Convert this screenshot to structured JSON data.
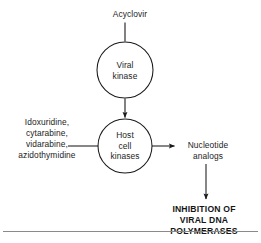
{
  "figure": {
    "background_color": "#ffffff",
    "stroke_color": "#1a1a1a",
    "rule_color": "#8a8a8a"
  },
  "nodes": {
    "viral_kinase": {
      "label": "Viral\nkinase",
      "shape": "circle",
      "cx": 125,
      "cy": 70,
      "r": 28
    },
    "host_cell_kinases": {
      "label": "Host\ncell\nkinases",
      "shape": "circle",
      "cx": 125,
      "cy": 146,
      "r": 27
    }
  },
  "labels": {
    "acyclovir": "Acyclovir",
    "substrates": "Idoxuridine,\ncytarabine,\nvidarabine,\nazidothymidine",
    "nucleotide_analogs": "Nucleotide\nanalogs",
    "inhibition": "INHIBITION OF\nVIRAL DNA POLYMERASES"
  },
  "connectors": [
    {
      "name": "acyclovir-to-viral-kinase",
      "from": "acyclovir",
      "to": "viral_kinase",
      "orientation": "vertical",
      "arrowhead": false
    },
    {
      "name": "viral-kinase-to-host-cell-kinases",
      "from": "viral_kinase",
      "to": "host_cell_kinases",
      "orientation": "vertical",
      "arrowhead": true
    },
    {
      "name": "substrates-to-host-cell-kinases",
      "from": "substrates",
      "to": "host_cell_kinases",
      "orientation": "horizontal",
      "arrowhead": false
    },
    {
      "name": "host-cell-kinases-to-nucleotide-analogs",
      "from": "host_cell_kinases",
      "to": "nucleotide_analogs",
      "orientation": "horizontal",
      "arrowhead": true
    },
    {
      "name": "nucleotide-analogs-to-inhibition",
      "from": "nucleotide_analogs",
      "to": "inhibition",
      "orientation": "vertical",
      "arrowhead": true
    }
  ]
}
